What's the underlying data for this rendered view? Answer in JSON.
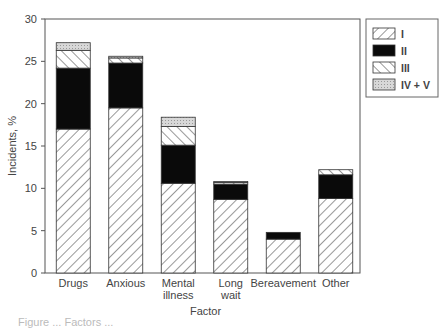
{
  "chart_data": {
    "type": "bar",
    "stacked": true,
    "title": "",
    "xlabel": "Factor",
    "ylabel": "Incidents, %",
    "ylim": [
      0,
      30
    ],
    "yticks": [
      0,
      5,
      10,
      15,
      20,
      25,
      30
    ],
    "grid": false,
    "legend_position": "top-right",
    "categories": [
      "Drugs",
      "Anxious",
      "Mental illness",
      "Long wait",
      "Bereavement",
      "Other"
    ],
    "category_lines": [
      [
        "Drugs"
      ],
      [
        "Anxious"
      ],
      [
        "Mental",
        "illness"
      ],
      [
        "Long",
        "wait"
      ],
      [
        "Bereavement"
      ],
      [
        "Other"
      ]
    ],
    "series": [
      {
        "name": "I",
        "pattern": "diag-right",
        "values": [
          17.0,
          19.5,
          10.6,
          8.7,
          4.0,
          8.8
        ]
      },
      {
        "name": "II",
        "pattern": "solid-black",
        "values": [
          7.2,
          5.3,
          4.5,
          1.8,
          0.8,
          2.8
        ]
      },
      {
        "name": "III",
        "pattern": "diag-left",
        "values": [
          2.1,
          0.6,
          2.2,
          0.2,
          0.0,
          0.6
        ]
      },
      {
        "name": "IV + V",
        "pattern": "stipple-gray",
        "values": [
          0.9,
          0.2,
          1.1,
          0.1,
          0.0,
          0.0
        ]
      }
    ]
  },
  "caption": "Figure ... Factors ..."
}
